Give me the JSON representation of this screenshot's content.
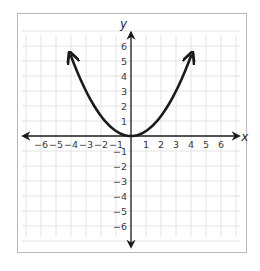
{
  "chart_data": {
    "type": "line",
    "title": "",
    "xlabel": "x",
    "ylabel": "y",
    "xlim": [
      -7,
      7
    ],
    "ylim": [
      -7,
      7
    ],
    "grid": true,
    "x_ticks": [
      -6,
      -5,
      -4,
      -3,
      -2,
      -1,
      1,
      2,
      3,
      4,
      5,
      6
    ],
    "y_ticks": [
      6,
      5,
      4,
      3,
      2,
      1,
      -1,
      -2,
      -3,
      -4,
      -5,
      -6
    ],
    "x_tick_labels": [
      "−6",
      "−5",
      "−4",
      "−3",
      "−2",
      "−1",
      "1",
      "2",
      "3",
      "4",
      "5",
      "6"
    ],
    "y_tick_labels": [
      "6",
      "5",
      "4",
      "3",
      "2",
      "1",
      "−1",
      "−2",
      "−3",
      "−4",
      "−5",
      "−6"
    ],
    "series": [
      {
        "name": "parabola",
        "equation": "y = x^2 / 3",
        "x": [
          -4,
          -3,
          -2,
          -1,
          0,
          1,
          2,
          3,
          4
        ],
        "y": [
          5.33,
          3,
          1.33,
          0.33,
          0,
          0.33,
          1.33,
          3,
          5.33
        ],
        "arrow_ends": true,
        "color": "#1a1a1a"
      }
    ],
    "axis_color": "#1a1a1a",
    "grid_color": "#e4e4e4"
  }
}
